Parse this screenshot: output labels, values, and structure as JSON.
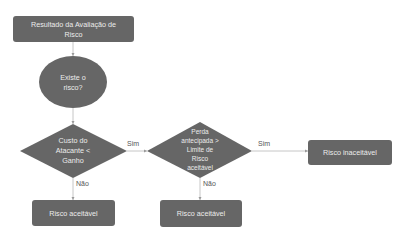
{
  "diagram": {
    "type": "flowchart",
    "colors": {
      "node_fill": "#666666",
      "node_text": "#ececec",
      "edge": "#b8b8b8",
      "label_text": "#555555",
      "background": "#ffffff"
    },
    "nodes": {
      "start": {
        "shape": "rounded-rect",
        "lines": [
          "Resultado da Avaliação de",
          "Risco"
        ]
      },
      "exists": {
        "shape": "ellipse",
        "lines": [
          "Existe o",
          "risco?"
        ]
      },
      "cost": {
        "shape": "diamond",
        "lines": [
          "Custo do",
          "Atacante <",
          "Ganho"
        ]
      },
      "loss": {
        "shape": "diamond",
        "lines": [
          "Perda",
          "antecipada >",
          "Limite de",
          "Risco",
          "aceitável"
        ]
      },
      "accept1": {
        "shape": "rounded-rect",
        "lines": [
          "Risco aceitável"
        ]
      },
      "accept2": {
        "shape": "rounded-rect",
        "lines": [
          "Risco aceitável"
        ]
      },
      "reject": {
        "shape": "rounded-rect",
        "lines": [
          "Risco inaceitável"
        ]
      }
    },
    "edges": [
      {
        "from": "start",
        "to": "exists",
        "label": ""
      },
      {
        "from": "exists",
        "to": "cost",
        "label": ""
      },
      {
        "from": "cost",
        "to": "loss",
        "label": "Sim"
      },
      {
        "from": "cost",
        "to": "accept1",
        "label": "Não"
      },
      {
        "from": "loss",
        "to": "reject",
        "label": "Sim"
      },
      {
        "from": "loss",
        "to": "accept2",
        "label": "Não"
      }
    ]
  }
}
